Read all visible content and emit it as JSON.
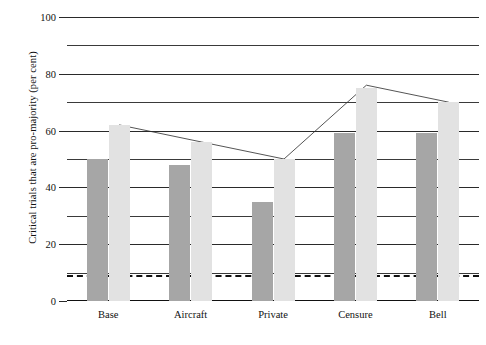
{
  "chart_data": {
    "type": "bar",
    "title": "",
    "xlabel": "",
    "ylabel": "Critical trials that are pro-majority (per cent)",
    "categories": [
      "Base",
      "Aircraft",
      "Private",
      "Censure",
      "Bell"
    ],
    "series": [
      {
        "name": "dark-bars",
        "color": "#a6a6a6",
        "values": [
          50,
          48,
          35,
          59,
          59
        ]
      },
      {
        "name": "light-bars",
        "color": "#e2e2e2",
        "values": [
          62,
          56,
          50,
          75,
          70
        ]
      }
    ],
    "overlay_line": {
      "name": "trend-line",
      "color": "#555555",
      "values": [
        62,
        56,
        50,
        76,
        70
      ]
    },
    "threshold_line": {
      "value": 9,
      "style": "dashed",
      "color": "#111111"
    },
    "ylim": [
      0,
      100
    ],
    "ytick_labels": [
      "0",
      "20",
      "40",
      "60",
      "80",
      "100"
    ],
    "ytick_values": [
      0,
      20,
      40,
      60,
      80,
      100
    ],
    "gridline_values": [
      10,
      20,
      30,
      40,
      50,
      60,
      70,
      80,
      90,
      100
    ],
    "grid": true,
    "legend": "none"
  }
}
